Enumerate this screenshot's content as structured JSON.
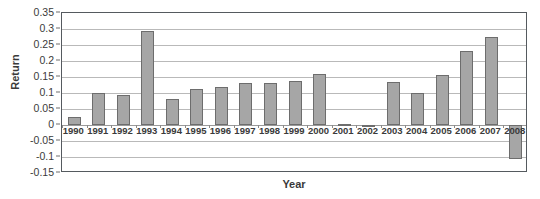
{
  "chart_data": {
    "type": "bar",
    "title": "",
    "xlabel": "Year",
    "ylabel": "Return",
    "categories": [
      "1990",
      "1991",
      "1992",
      "1993",
      "1994",
      "1995",
      "1996",
      "1997",
      "1998",
      "1999",
      "2000",
      "2001",
      "2002",
      "2003",
      "2004",
      "2005",
      "2006",
      "2007",
      "2008"
    ],
    "values": [
      0.025,
      0.1,
      0.095,
      0.295,
      0.082,
      0.112,
      0.12,
      0.13,
      0.13,
      0.137,
      0.16,
      0.003,
      -0.005,
      0.135,
      0.1,
      0.155,
      0.23,
      0.275,
      -0.105
    ],
    "ylim": [
      -0.15,
      0.35
    ],
    "yticks": [
      0.35,
      0.3,
      0.25,
      0.2,
      0.15,
      0.1,
      0.05,
      0,
      -0.05,
      -0.1,
      -0.15
    ],
    "ytick_labels": [
      "0.35",
      "0.3",
      "0.25",
      "0.2",
      "0.15",
      "0.1",
      "0.05",
      "0",
      "-0.05",
      "-0.1",
      "-0.15"
    ],
    "grid": true,
    "legend": false,
    "bar_color": "#a6a6a6",
    "bar_edge_color": "#6d6d6d",
    "grid_color": "#b9b9b9",
    "axis_color": "#555a5f"
  }
}
